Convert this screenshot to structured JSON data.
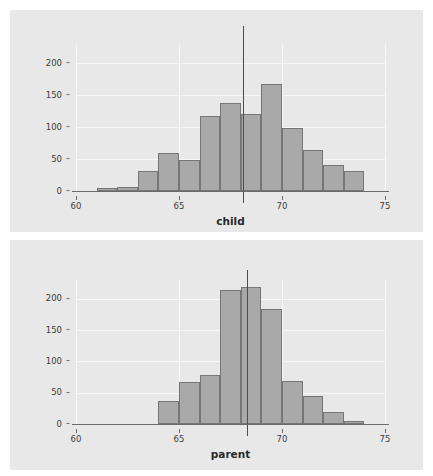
{
  "figure": {
    "background_color": "#ffffff",
    "panel_background_color": "#e8e8e8",
    "bar_fill_color": "#a9a9a9",
    "bar_border_color": "#767676",
    "gridline_color": "#f7f7f7",
    "axis_color": "#6a6a6a",
    "refline_color": "#4a4a5a",
    "width": 433,
    "height": 476
  },
  "chart_data": [
    {
      "type": "bar",
      "name": "child-histogram",
      "title": "",
      "xlabel": "child",
      "ylabel": "",
      "xlim": [
        60,
        75
      ],
      "ylim": [
        0,
        230
      ],
      "grid": true,
      "legend": "none",
      "xticks": [
        "60",
        "65",
        "70",
        "75"
      ],
      "xtick_values": [
        60,
        65,
        70,
        75
      ],
      "yticks": [
        "0",
        "50",
        "100",
        "150",
        "200"
      ],
      "ytick_values": [
        0,
        50,
        100,
        150,
        200
      ],
      "bin_width": 1,
      "bin_starts": [
        61,
        62,
        63,
        64,
        65,
        66,
        67,
        68,
        69,
        70,
        71,
        72,
        73
      ],
      "bin_labels": [
        "61-62",
        "62-63",
        "63-64",
        "64-65",
        "65-66",
        "66-67",
        "67-68",
        "68-69",
        "69-70",
        "70-71",
        "71-72",
        "72-73",
        "73-74"
      ],
      "values": [
        5,
        7,
        32,
        59,
        48,
        117,
        138,
        120,
        167,
        99,
        64,
        41,
        32
      ],
      "annotations": [
        {
          "kind": "vertical-reference-line",
          "x": 68.1,
          "label": "mean"
        }
      ]
    },
    {
      "type": "bar",
      "name": "parent-histogram",
      "title": "",
      "xlabel": "parent",
      "ylabel": "",
      "xlim": [
        60,
        75
      ],
      "ylim": [
        0,
        230
      ],
      "grid": true,
      "legend": "none",
      "xticks": [
        "60",
        "65",
        "70",
        "75"
      ],
      "xtick_values": [
        60,
        65,
        70,
        75
      ],
      "yticks": [
        "0",
        "50",
        "100",
        "150",
        "200"
      ],
      "ytick_values": [
        0,
        50,
        100,
        150,
        200
      ],
      "bin_width": 1,
      "bin_starts": [
        64,
        65,
        66,
        67,
        68,
        69,
        70,
        71,
        72,
        73
      ],
      "bin_labels": [
        "64-65",
        "65-66",
        "66-67",
        "67-68",
        "68-69",
        "69-70",
        "70-71",
        "71-72",
        "72-73",
        "73-74"
      ],
      "values": [
        36,
        67,
        79,
        214,
        219,
        183,
        68,
        45,
        19,
        4
      ],
      "annotations": [
        {
          "kind": "vertical-reference-line",
          "x": 68.3,
          "label": "mean"
        }
      ]
    }
  ]
}
